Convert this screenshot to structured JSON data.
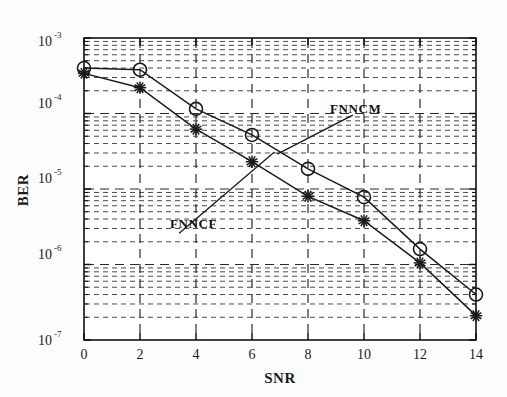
{
  "chart_data": {
    "type": "line",
    "title": "",
    "xlabel": "SNR",
    "ylabel": "BER",
    "xlim": [
      0,
      14
    ],
    "ylim": [
      1e-07,
      0.001
    ],
    "yscale": "log",
    "xscale": "linear",
    "grid": true,
    "grid_style": "dashed",
    "legend_position": "annotations-inline",
    "x": [
      0,
      2,
      4,
      6,
      8,
      10,
      12,
      14
    ],
    "xticks": [
      "0",
      "2",
      "4",
      "6",
      "8",
      "10",
      "12",
      "14"
    ],
    "yticks": [
      "10^-3",
      "10^-4",
      "10^-5",
      "10^-6",
      "10^-7"
    ],
    "ytick_bases": [
      "10",
      "10",
      "10",
      "10",
      "10"
    ],
    "ytick_exponents": [
      "-3",
      "-4",
      "-5",
      "-6",
      "-7"
    ],
    "series": [
      {
        "name": "FNNCM",
        "marker": "circle",
        "color": "#1a1a1a",
        "values": [
          0.0004,
          0.00038,
          0.000115,
          5.2e-05,
          1.85e-05,
          7.8e-06,
          1.6e-06,
          4e-07
        ]
      },
      {
        "name": "FNNCF",
        "marker": "star",
        "color": "#1a1a1a",
        "values": [
          0.00034,
          0.00022,
          6.2e-05,
          2.3e-05,
          8e-06,
          3.8e-06,
          1.05e-06,
          2.1e-07
        ]
      }
    ],
    "annotations": [
      {
        "text": "FNNCM",
        "text_x": 9.6,
        "text_y": 9.5e-05,
        "arrow_to_x": 6.9,
        "arrow_to_y": 2.9e-05
      },
      {
        "text": "FNNCF",
        "text_x": 3.4,
        "text_y": 2.6e-06,
        "arrow_to_x": 6.8,
        "arrow_to_y": 3.1e-05
      }
    ]
  },
  "figure": {
    "axis_labels": {
      "x": "SNR",
      "y": "BER"
    },
    "annotation_upper": "FNNCM",
    "annotation_lower": "FNNCF",
    "ytick_0_base": "10",
    "ytick_0_exp": "-3",
    "ytick_1_base": "10",
    "ytick_1_exp": "-4",
    "ytick_2_base": "10",
    "ytick_2_exp": "-5",
    "ytick_3_base": "10",
    "ytick_3_exp": "-6",
    "ytick_4_base": "10",
    "ytick_4_exp": "-7",
    "xtick_0": "0",
    "xtick_1": "2",
    "xtick_2": "4",
    "xtick_3": "6",
    "xtick_4": "8",
    "xtick_5": "10",
    "xtick_6": "12",
    "xtick_7": "14"
  },
  "colors": {
    "line": "#1a1a1a",
    "grid": "#2b2b2b",
    "axis": "#111111",
    "background": "#fdfdfd"
  }
}
